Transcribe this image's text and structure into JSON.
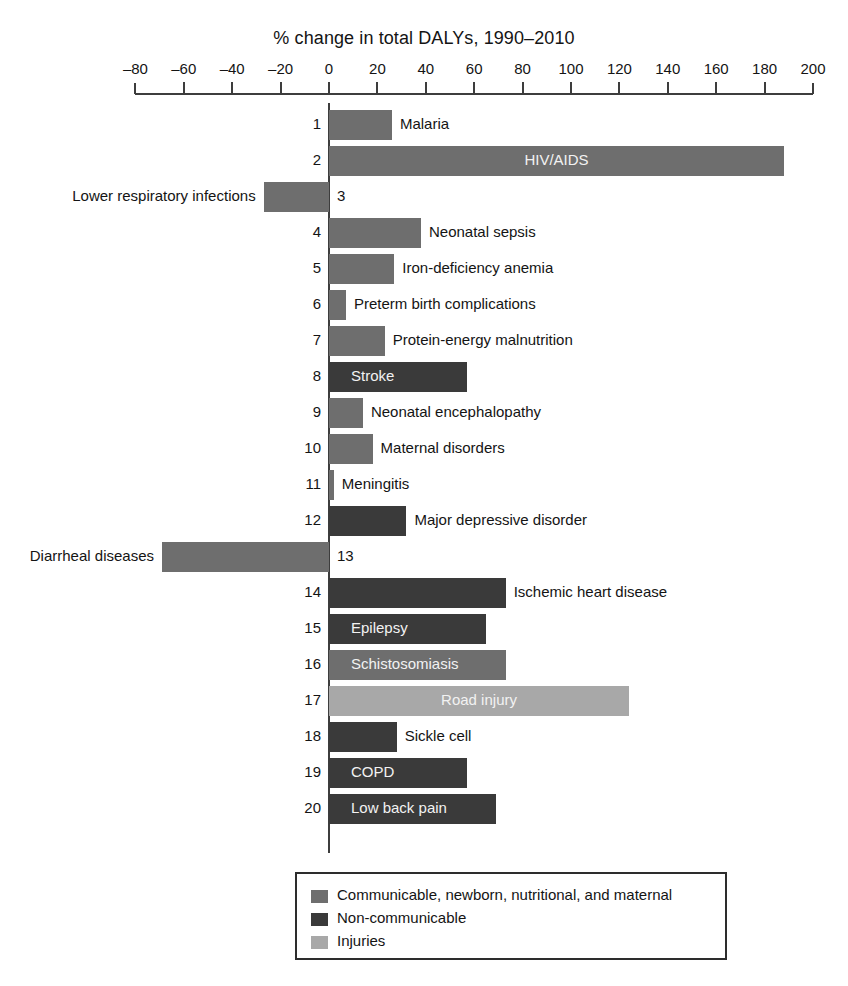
{
  "chart_data": {
    "type": "bar",
    "orientation": "horizontal",
    "title": "% change in total DALYs, 1990–2010",
    "xlabel": "",
    "ylabel": "",
    "xlim": [
      -80,
      200
    ],
    "xticks": [
      -80,
      -60,
      -40,
      -20,
      0,
      20,
      40,
      60,
      80,
      100,
      120,
      140,
      160,
      180,
      200
    ],
    "xtick_labels": [
      "–80",
      "–60",
      "–40",
      "–20",
      "0",
      "20",
      "40",
      "60",
      "80",
      "100",
      "120",
      "140",
      "160",
      "180",
      "200"
    ],
    "grid": false,
    "legend_position": "bottom-center",
    "categories_legend": [
      {
        "key": "communicable",
        "label": "Communicable, newborn, nutritional, and maternal",
        "color": "#6e6e6e"
      },
      {
        "key": "noncommunicable",
        "label": "Non-communicable",
        "color": "#3a3a3a"
      },
      {
        "key": "injuries",
        "label": "Injuries",
        "color": "#a8a8a8"
      }
    ],
    "categories": [
      "Malaria",
      "HIV/AIDS",
      "Lower respiratory infections",
      "Neonatal sepsis",
      "Iron-deficiency anemia",
      "Preterm birth complications",
      "Protein-energy malnutrition",
      "Stroke",
      "Neonatal encephalopathy",
      "Maternal disorders",
      "Meningitis",
      "Major depressive disorder",
      "Diarrheal diseases",
      "Ischemic heart disease",
      "Epilepsy",
      "Schistosomiasis",
      "Road injury",
      "Sickle cell",
      "COPD",
      "Low back pain"
    ],
    "values": [
      26,
      188,
      -27,
      38,
      27,
      7,
      23,
      57,
      14,
      18,
      2,
      32,
      -69,
      73,
      65,
      73,
      124,
      28,
      57,
      69
    ],
    "bars": [
      {
        "rank": "1",
        "label": "Malaria",
        "value": 26,
        "group": "communicable",
        "label_placement": "right"
      },
      {
        "rank": "2",
        "label": "HIV/AIDS",
        "value": 188,
        "group": "communicable",
        "label_placement": "inside"
      },
      {
        "rank": "3",
        "label": "Lower respiratory infections",
        "value": -27,
        "group": "communicable",
        "label_placement": "left"
      },
      {
        "rank": "4",
        "label": "Neonatal sepsis",
        "value": 38,
        "group": "communicable",
        "label_placement": "right"
      },
      {
        "rank": "5",
        "label": "Iron-deficiency anemia",
        "value": 27,
        "group": "communicable",
        "label_placement": "right"
      },
      {
        "rank": "6",
        "label": "Preterm birth complications",
        "value": 7,
        "group": "communicable",
        "label_placement": "right"
      },
      {
        "rank": "7",
        "label": "Protein-energy malnutrition",
        "value": 23,
        "group": "communicable",
        "label_placement": "right"
      },
      {
        "rank": "8",
        "label": "Stroke",
        "value": 57,
        "group": "noncommunicable",
        "label_placement": "inside"
      },
      {
        "rank": "9",
        "label": "Neonatal encephalopathy",
        "value": 14,
        "group": "communicable",
        "label_placement": "right"
      },
      {
        "rank": "10",
        "label": "Maternal disorders",
        "value": 18,
        "group": "communicable",
        "label_placement": "right"
      },
      {
        "rank": "11",
        "label": "Meningitis",
        "value": 2,
        "group": "communicable",
        "label_placement": "right"
      },
      {
        "rank": "12",
        "label": "Major depressive disorder",
        "value": 32,
        "group": "noncommunicable",
        "label_placement": "right"
      },
      {
        "rank": "13",
        "label": "Diarrheal diseases",
        "value": -69,
        "group": "communicable",
        "label_placement": "left"
      },
      {
        "rank": "14",
        "label": "Ischemic heart disease",
        "value": 73,
        "group": "noncommunicable",
        "label_placement": "right"
      },
      {
        "rank": "15",
        "label": "Epilepsy",
        "value": 65,
        "group": "noncommunicable",
        "label_placement": "inside"
      },
      {
        "rank": "16",
        "label": "Schistosomiasis",
        "value": 73,
        "group": "communicable",
        "label_placement": "inside"
      },
      {
        "rank": "17",
        "label": "Road injury",
        "value": 124,
        "group": "injuries",
        "label_placement": "inside"
      },
      {
        "rank": "18",
        "label": "Sickle cell",
        "value": 28,
        "group": "noncommunicable",
        "label_placement": "right"
      },
      {
        "rank": "19",
        "label": "COPD",
        "value": 57,
        "group": "noncommunicable",
        "label_placement": "inside"
      },
      {
        "rank": "20",
        "label": "Low back pain",
        "value": 69,
        "group": "noncommunicable",
        "label_placement": "inside"
      }
    ]
  }
}
